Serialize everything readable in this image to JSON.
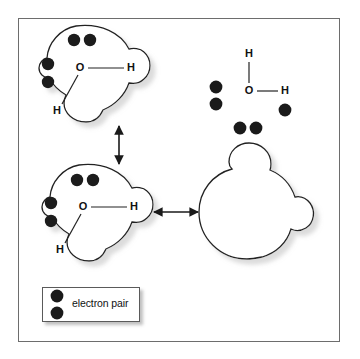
{
  "figure": {
    "background_color": "#ffffff",
    "frame_color": "#6d6d6d",
    "dot_color": "#1a1a1a",
    "outline_color": "#222222",
    "shadow_color": "#a8a8a8"
  },
  "legend": {
    "label": "electron pair",
    "dot_count": 2
  },
  "panels": [
    {
      "id": "space-filling-top-left",
      "name": "space-filling-water-top-left",
      "type": "space-filling-model",
      "labels": [
        {
          "text": "O",
          "x": 80,
          "y": 68
        },
        {
          "text": "H",
          "x": 131,
          "y": 68
        },
        {
          "text": "H",
          "x": 57,
          "y": 111
        }
      ],
      "electron_pairs": [
        {
          "x": 74,
          "y": 40
        },
        {
          "x": 90,
          "y": 40
        },
        {
          "x": 48,
          "y": 64
        },
        {
          "x": 48,
          "y": 82
        }
      ]
    },
    {
      "id": "space-filling-bottom-left",
      "name": "space-filling-water-bottom-left",
      "type": "space-filling-model",
      "labels": [
        {
          "text": "O",
          "x": 83,
          "y": 207
        },
        {
          "text": "H",
          "x": 134,
          "y": 207
        },
        {
          "text": "H",
          "x": 60,
          "y": 250
        }
      ],
      "electron_pairs": [
        {
          "x": 77,
          "y": 180
        },
        {
          "x": 93,
          "y": 180
        },
        {
          "x": 51,
          "y": 203
        },
        {
          "x": 51,
          "y": 221
        }
      ]
    },
    {
      "id": "lewis-structure-top-right",
      "name": "lewis-structure-water",
      "type": "lewis-dot-structure",
      "labels": [
        {
          "text": "H",
          "x": 249,
          "y": 54
        },
        {
          "text": "O",
          "x": 249,
          "y": 91
        },
        {
          "text": "H",
          "x": 285,
          "y": 91
        }
      ],
      "bonds": [
        {
          "kind": "vertical",
          "x": 249,
          "y1": 62,
          "y2": 83
        },
        {
          "kind": "horizontal",
          "y": 91,
          "x1": 257,
          "x2": 278
        }
      ],
      "electron_pairs": [
        {
          "x": 216,
          "y": 87
        },
        {
          "x": 216,
          "y": 104
        },
        {
          "x": 240,
          "y": 128
        },
        {
          "x": 256,
          "y": 128
        },
        {
          "x": 285,
          "y": 110
        }
      ]
    },
    {
      "id": "space-filling-bottom-right",
      "name": "space-filling-water-blank",
      "type": "space-filling-model-blank",
      "labels": [],
      "electron_pairs": []
    }
  ],
  "arrows": [
    {
      "id": "arrow-vertical",
      "name": "double-headed-arrow-vertical",
      "orientation": "vertical",
      "x": 119,
      "y1": 124,
      "y2": 166
    },
    {
      "id": "arrow-horizontal",
      "name": "double-headed-arrow-horizontal",
      "orientation": "horizontal",
      "y": 212,
      "x1": 152,
      "x2": 200
    }
  ]
}
